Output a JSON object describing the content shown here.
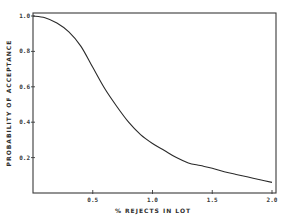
{
  "chart_data": {
    "type": "line",
    "title": "",
    "xlabel": "% REJECTS IN LOT",
    "ylabel": "PROBABILITY OF ACCEPTANCE",
    "xlim": [
      0,
      2.0
    ],
    "ylim": [
      0,
      1.0
    ],
    "grid": false,
    "legend": null,
    "x_ticks": [
      {
        "value": 0.5,
        "label": "0.5"
      },
      {
        "value": 1.0,
        "label": "1.0"
      },
      {
        "value": 1.5,
        "label": "1.5"
      },
      {
        "value": 2.0,
        "label": "2.0"
      }
    ],
    "y_ticks": [
      {
        "value": 0.2,
        "label": "0.2"
      },
      {
        "value": 0.4,
        "label": "0.4"
      },
      {
        "value": 0.6,
        "label": "0.6"
      },
      {
        "value": 0.8,
        "label": "0.8"
      },
      {
        "value": 1.0,
        "label": "1.0"
      }
    ],
    "series": [
      {
        "name": "OC curve",
        "color": "#2a2a2a",
        "x": [
          0.0,
          0.1,
          0.2,
          0.3,
          0.4,
          0.5,
          0.6,
          0.7,
          0.8,
          0.9,
          1.0,
          1.1,
          1.2,
          1.3,
          1.4,
          1.5,
          1.6,
          1.7,
          1.8,
          1.9,
          2.0
        ],
        "y": [
          1.0,
          0.99,
          0.96,
          0.91,
          0.83,
          0.71,
          0.59,
          0.49,
          0.4,
          0.33,
          0.28,
          0.24,
          0.2,
          0.17,
          0.155,
          0.14,
          0.12,
          0.105,
          0.09,
          0.075,
          0.06
        ]
      }
    ]
  }
}
